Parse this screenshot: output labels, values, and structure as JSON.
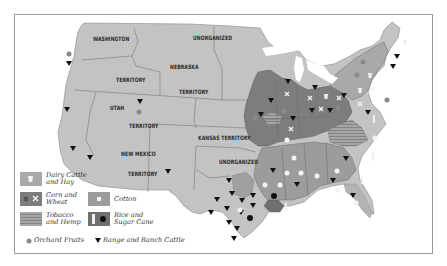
{
  "map": {
    "title": "",
    "colors": {
      "background": "#ffffff",
      "frame": "#9a9a9a",
      "land_default": "#c3c3c3",
      "dairy_hay": "#a8a8a8",
      "corn_wheat": "#7b7b7b",
      "tobacco_hemp": "#9e9e9e",
      "cotton": "#9a9a9a",
      "rice_sugar": "#6e6e6e",
      "border": "#6a6a6a",
      "marker": "#111111"
    },
    "region_labels": [
      {
        "text": "WASHINGTON",
        "x": 93,
        "y": 38
      },
      {
        "text": "UNORGANIZED",
        "x": 193,
        "y": 37
      },
      {
        "text": "NEBRASKA",
        "x": 170,
        "y": 66
      },
      {
        "text": "TERRITORY",
        "x": 116,
        "y": 78
      },
      {
        "text": "TERRITORY",
        "x": 179,
        "y": 90
      },
      {
        "text": "UTAH",
        "x": 110,
        "y": 106
      },
      {
        "text": "TERRITORY",
        "x": 129,
        "y": 124
      },
      {
        "text": "KANSAS TERRITORY",
        "x": 198,
        "y": 137
      },
      {
        "text": "NEW MEXICO",
        "x": 121,
        "y": 152
      },
      {
        "text": "TERRITORY",
        "x": 128,
        "y": 172
      },
      {
        "text": "UNORGANIZED",
        "x": 219,
        "y": 160
      }
    ]
  },
  "legend": {
    "items": [
      {
        "id": "dairy",
        "label": "Dairy Cattle\nand Hay"
      },
      {
        "id": "corn",
        "label": "Corn and\nWheat"
      },
      {
        "id": "cotton",
        "label": "Cotton"
      },
      {
        "id": "tobacco",
        "label": "Tobacco\nand Hemp"
      },
      {
        "id": "rice",
        "label": "Rice and\nSugar Cane"
      },
      {
        "id": "orchard",
        "label": "Orchard Fruits"
      },
      {
        "id": "cattle",
        "label": "Range and Ranch Cattle"
      }
    ]
  }
}
